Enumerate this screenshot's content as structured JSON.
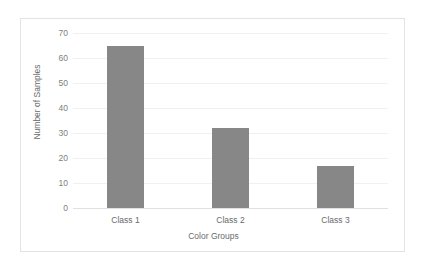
{
  "chart_data": {
    "type": "bar",
    "title": "",
    "xlabel": "Color Groups",
    "ylabel": "Number of Samples",
    "categories": [
      "Class 1",
      "Class 2",
      "Class 3"
    ],
    "values": [
      65,
      32,
      17
    ],
    "ylim": [
      0,
      70
    ],
    "yticks": [
      0,
      10,
      20,
      30,
      40,
      50,
      60,
      70
    ],
    "ytick_labels": [
      "0",
      "10",
      "20",
      "30",
      "40",
      "50",
      "60",
      "70"
    ],
    "grid": true,
    "legend": false,
    "bar_color": "#878787",
    "gridline_color": "#f0f0f0",
    "axis_text_color": "#6a6a6a",
    "frame_color": "#e3e3e3",
    "background_color": "#ffffff"
  }
}
